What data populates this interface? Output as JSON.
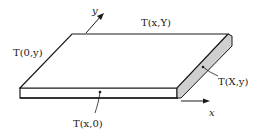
{
  "diagram": {
    "axes": {
      "x": {
        "label": "x"
      },
      "y": {
        "label": "y"
      }
    },
    "boundary_labels": {
      "top": "T(x,Y)",
      "left": "T(0,y)",
      "bottom": "T(x,0)",
      "right": "T(X,y)"
    },
    "colors": {
      "line": "#1a1a1a",
      "side_face": "#cfcfcf",
      "background": "#ffffff"
    }
  }
}
